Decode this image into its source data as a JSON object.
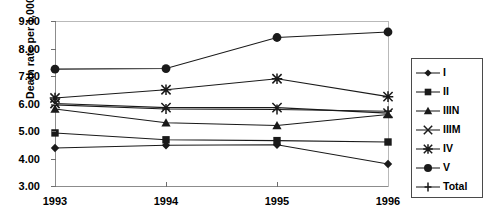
{
  "chart_data": {
    "type": "line",
    "title": "",
    "xlabel": "",
    "ylabel": "Death rate per 1,000",
    "x": [
      "1993",
      "1994",
      "1995",
      "1996"
    ],
    "categories": [
      "1993",
      "1994",
      "1995",
      "1996"
    ],
    "ylim": [
      3.0,
      9.0
    ],
    "ytick_labels": [
      "9.00",
      "8.00",
      "7.00",
      "6.00",
      "5.00",
      "4.00",
      "3.00"
    ],
    "ytick_values": [
      9.0,
      8.0,
      7.0,
      6.0,
      5.0,
      4.0,
      3.0
    ],
    "grid": false,
    "legend_position": "right",
    "series": [
      {
        "name": "I",
        "marker": "diamond",
        "values": [
          4.38,
          4.48,
          4.5,
          3.8
        ]
      },
      {
        "name": "II",
        "marker": "square",
        "values": [
          4.93,
          4.68,
          4.65,
          4.6
        ]
      },
      {
        "name": "IIIN",
        "marker": "triangle",
        "values": [
          5.8,
          5.3,
          5.2,
          5.6
        ]
      },
      {
        "name": "IIIM",
        "marker": "cross-x",
        "values": [
          6.0,
          5.85,
          5.85,
          5.65
        ]
      },
      {
        "name": "IV",
        "marker": "asterisk",
        "values": [
          6.2,
          6.5,
          6.9,
          6.25
        ]
      },
      {
        "name": "V",
        "marker": "circle",
        "values": [
          7.25,
          7.27,
          8.4,
          8.6
        ]
      },
      {
        "name": "Total",
        "marker": "plus",
        "values": [
          5.95,
          5.8,
          5.78,
          5.72
        ]
      }
    ],
    "legend_entries": [
      {
        "label": "I",
        "marker": "diamond"
      },
      {
        "label": "II",
        "marker": "square"
      },
      {
        "label": "IIIN",
        "marker": "triangle"
      },
      {
        "label": "IIIM",
        "marker": "cross-x"
      },
      {
        "label": "IV",
        "marker": "asterisk"
      },
      {
        "label": "V",
        "marker": "circle"
      },
      {
        "label": "Total",
        "marker": "plus"
      }
    ],
    "colors": {
      "series": "#1a1a1a",
      "axis": "#8c8c8c",
      "text": "#000000",
      "background": "#ffffff"
    }
  }
}
